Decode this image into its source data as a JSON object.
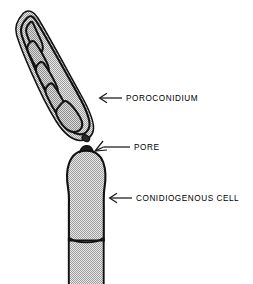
{
  "figure": {
    "background_color": "#ffffff",
    "width": 253,
    "height": 284
  },
  "style": {
    "outline_color": "#111111",
    "fill_gray": "#c9c9c9",
    "fill_gray_dark": "#b9b9b9",
    "arrow_color": "#1a1a1a",
    "text_color": "#000000"
  },
  "labels": [
    {
      "id": "poroconidium",
      "text": "POROCONIDIUM",
      "arrow_name": "arrow-to-poroconidium"
    },
    {
      "id": "pore",
      "text": "PORE",
      "arrow_name": "arrow-to-pore"
    },
    {
      "id": "conidiogenous_cell",
      "text": "CONIDIOGENOUS CELL",
      "arrow_name": "arrow-to-conidiogenous-cell"
    }
  ],
  "structures": {
    "poroconidium": {
      "name": "poroconidium",
      "description": "elongate obclavate multiseptate spore",
      "compartment_count": 5
    },
    "pore": {
      "name": "pore",
      "description": "apical channel through which the conidium is extruded"
    },
    "conidiogenous_cell": {
      "name": "conidiogenous-cell",
      "description": "flask shaped cell borne on a hypha, separated by a basal septum"
    },
    "hypha": {
      "name": "supporting-hypha",
      "description": "cylindrical stalk below the basal septum"
    }
  }
}
